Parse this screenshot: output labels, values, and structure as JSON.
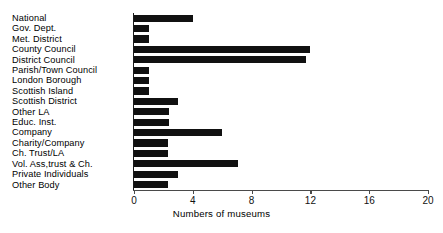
{
  "chart_data": {
    "type": "bar",
    "orientation": "horizontal",
    "title": "",
    "xlabel": "Numbers of museums",
    "ylabel": "",
    "xlim": [
      0,
      20
    ],
    "xticks": [
      0,
      4,
      8,
      12,
      16,
      20
    ],
    "grid": false,
    "legend": null,
    "categories": [
      "National",
      "Gov. Dept.",
      "Met. District",
      "County Council",
      "District Council",
      "Parish/Town Council",
      "London Borough",
      "Scottish Island",
      "Scottish District",
      "Other LA",
      "Educ. Inst.",
      "Company",
      "Charity/Company",
      "Ch. Trust/LA",
      "Vol. Ass,trust & Ch.",
      "Private Individuals",
      "Other Body"
    ],
    "values": [
      4,
      1,
      1,
      12,
      11.7,
      1,
      1,
      1,
      3,
      2.4,
      2.4,
      6,
      2.3,
      2.3,
      7.1,
      3,
      2.3
    ],
    "bar_color": "#111111",
    "axis_color": "#1a1a1a"
  }
}
